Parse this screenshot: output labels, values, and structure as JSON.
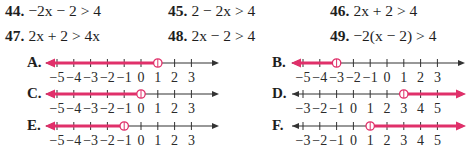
{
  "problems": [
    {
      "number": "44.",
      "expr": "−2x − 2 > 4"
    },
    {
      "number": "45.",
      "expr": "2 − 2x > 4"
    },
    {
      "number": "46.",
      "expr": "2x + 2 > 4"
    },
    {
      "number": "47.",
      "expr": "2x + 2 > 4x"
    },
    {
      "number": "48.",
      "expr": "2x − 2 > 4"
    },
    {
      "number": "49.",
      "expr": "−2(x − 2) > 4"
    }
  ],
  "options": [
    {
      "label": "A.",
      "ticks": [
        -5,
        -4,
        -3,
        -2,
        -1,
        0,
        1,
        2,
        3
      ],
      "endpoint": 1,
      "open": true,
      "direction": "left"
    },
    {
      "label": "B.",
      "ticks": [
        -5,
        -4,
        -3,
        -2,
        -1,
        0,
        1,
        2,
        3
      ],
      "endpoint": -3,
      "open": true,
      "direction": "left"
    },
    {
      "label": "C.",
      "ticks": [
        -5,
        -4,
        -3,
        -2,
        -1,
        0,
        1,
        2,
        3
      ],
      "endpoint": 0,
      "open": true,
      "direction": "left"
    },
    {
      "label": "D.",
      "ticks": [
        -3,
        -2,
        -1,
        0,
        1,
        2,
        3,
        4,
        5
      ],
      "endpoint": 3,
      "open": true,
      "direction": "right"
    },
    {
      "label": "E.",
      "ticks": [
        -5,
        -4,
        -3,
        -2,
        -1,
        0,
        1,
        2,
        3
      ],
      "endpoint": -1,
      "open": true,
      "direction": "left"
    },
    {
      "label": "F.",
      "ticks": [
        -3,
        -2,
        -1,
        0,
        1,
        2,
        3,
        4,
        5
      ],
      "endpoint": 1,
      "open": true,
      "direction": "right"
    }
  ],
  "colors": {
    "highlight": "#e0306a",
    "axis": "#333333"
  }
}
